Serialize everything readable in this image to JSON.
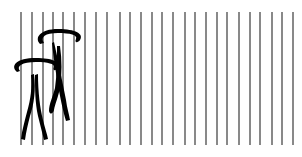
{
  "scene": {
    "width": 302,
    "height": 157,
    "background": "#ffffff",
    "lines": {
      "color": "#4a4a4a",
      "y_top": 12,
      "y_bottom": 145,
      "stroke_width": 1.3,
      "x_positions": [
        21,
        32,
        43,
        53,
        63,
        74,
        85,
        96,
        107,
        120,
        130,
        141,
        152,
        162,
        173,
        185,
        195,
        206,
        217,
        227,
        239,
        250,
        260,
        272,
        282,
        293
      ]
    },
    "figures": [
      {
        "name": "rear-figure",
        "color": "#000000",
        "ring": {
          "cx": 59,
          "cy": 35,
          "rx": 21,
          "ry": 6
        },
        "legs": [
          {
            "from": [
              56,
              42
            ],
            "to": [
              68,
              118
            ]
          },
          {
            "from": [
              62,
              44
            ],
            "to": [
              52,
              112
            ]
          }
        ]
      },
      {
        "name": "front-figure",
        "color": "#000000",
        "ring": {
          "cx": 36,
          "cy": 64,
          "rx": 22,
          "ry": 6
        },
        "legs": [
          {
            "from": [
              36,
              74
            ],
            "to": [
              24,
              138
            ]
          },
          {
            "from": [
              40,
              74
            ],
            "to": [
              46,
              138
            ]
          }
        ]
      }
    ]
  }
}
